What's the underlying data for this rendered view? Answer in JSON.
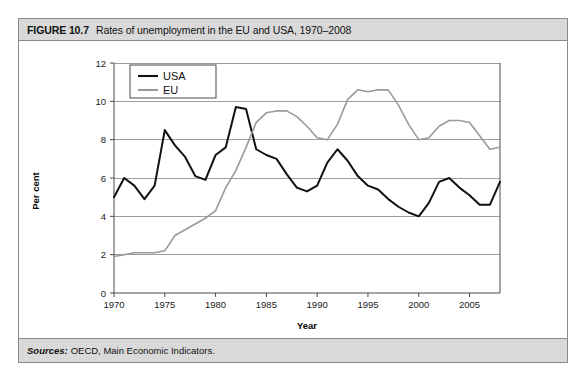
{
  "figure": {
    "number": "FIGURE 10.7",
    "title": "Rates of unemployment in the EU and USA, 1970–2008",
    "source_label": "Sources:",
    "source_text": "OECD, Main Economic Indicators."
  },
  "colors": {
    "title_bar_bg": "#d9d9d9",
    "border": "#8a8a8a",
    "usa_line": "#111111",
    "eu_line": "#9a9a9a",
    "grid": "#9d9d9d",
    "axis": "#4a4a4a",
    "plot_bg": "#ffffff"
  },
  "chart_data": {
    "type": "line",
    "title": "Rates of unemployment in the EU and USA, 1970–2008",
    "xlabel": "Year",
    "ylabel": "Per cent",
    "xlim": [
      1970,
      2008
    ],
    "ylim": [
      0,
      12
    ],
    "ytick_values": [
      0,
      2,
      4,
      6,
      8,
      10,
      12
    ],
    "ytick_labels": [
      "0",
      "2",
      "4",
      "6",
      "8",
      "10",
      "12"
    ],
    "xtick_values": [
      1970,
      1975,
      1980,
      1985,
      1990,
      1995,
      2000,
      2005
    ],
    "xtick_labels": [
      "1970",
      "1975",
      "1980",
      "1985",
      "1990",
      "1995",
      "2000",
      "2005"
    ],
    "grid": "horizontal",
    "legend_position": "top-left",
    "x": [
      1970,
      1971,
      1972,
      1973,
      1974,
      1975,
      1976,
      1977,
      1978,
      1979,
      1980,
      1981,
      1982,
      1983,
      1984,
      1985,
      1986,
      1987,
      1988,
      1989,
      1990,
      1991,
      1992,
      1993,
      1994,
      1995,
      1996,
      1997,
      1998,
      1999,
      2000,
      2001,
      2002,
      2003,
      2004,
      2005,
      2006,
      2007,
      2008
    ],
    "series": [
      {
        "name": "USA",
        "color": "#111111",
        "values": [
          5.0,
          6.0,
          5.6,
          4.9,
          5.6,
          8.5,
          7.7,
          7.1,
          6.1,
          5.9,
          7.2,
          7.6,
          9.7,
          9.6,
          7.5,
          7.2,
          7.0,
          6.2,
          5.5,
          5.3,
          5.6,
          6.8,
          7.5,
          6.9,
          6.1,
          5.6,
          5.4,
          4.9,
          4.5,
          4.2,
          4.0,
          4.7,
          5.8,
          6.0,
          5.5,
          5.1,
          4.6,
          4.6,
          5.8
        ]
      },
      {
        "name": "EU",
        "color": "#9a9a9a",
        "values": [
          1.9,
          2.0,
          2.1,
          2.1,
          2.1,
          2.2,
          3.0,
          3.3,
          3.6,
          3.9,
          4.3,
          5.5,
          6.4,
          7.6,
          8.9,
          9.4,
          9.5,
          9.5,
          9.2,
          8.7,
          8.1,
          8.0,
          8.8,
          10.1,
          10.6,
          10.5,
          10.6,
          10.6,
          9.8,
          8.8,
          8.0,
          8.1,
          8.7,
          9.0,
          9.0,
          8.9,
          8.2,
          7.5,
          7.6
        ]
      }
    ]
  }
}
